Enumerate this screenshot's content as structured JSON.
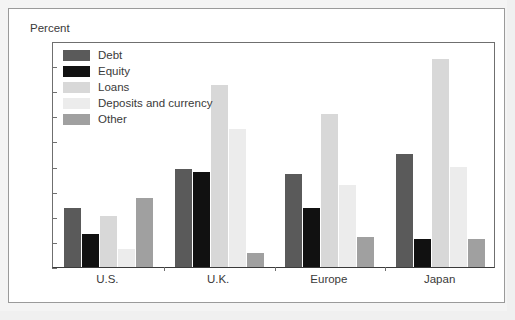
{
  "chart_data": {
    "type": "bar",
    "title": "",
    "subtitle": "",
    "xlabel": "",
    "ylabel": "Percent",
    "ylim": [
      0,
      180
    ],
    "ytick_step": 20,
    "yticks": [
      180,
      160,
      140,
      120,
      100,
      80,
      60,
      40,
      20,
      0
    ],
    "grid": false,
    "legend_position": "inside-top-left",
    "categories": [
      "U.S.",
      "U.K.",
      "Europe",
      "Japan"
    ],
    "series": [
      {
        "name": "Debt",
        "color": "#5a5a5a",
        "values": [
          47,
          78,
          74,
          90
        ]
      },
      {
        "name": "Equity",
        "color": "#111111",
        "values": [
          26,
          76,
          47,
          22
        ]
      },
      {
        "name": "Loans",
        "color": "#d8d8d8",
        "values": [
          41,
          145,
          122,
          166
        ]
      },
      {
        "name": "Deposits and currency",
        "color": "#ececec",
        "values": [
          14,
          110,
          65,
          80
        ]
      },
      {
        "name": "Other",
        "color": "#a0a0a0",
        "values": [
          55,
          11,
          24,
          22
        ]
      }
    ]
  },
  "axis": {
    "unit_caption": "Percent"
  },
  "colors": {
    "frame": "#9a9a9a",
    "axis": "#6f6f6f",
    "baseline": "#3a3a3a",
    "text": "#3a3a3a",
    "panel": "#ffffff",
    "page": "#f4f4f4"
  }
}
